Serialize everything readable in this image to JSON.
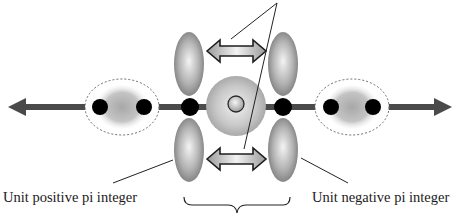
{
  "diagram": {
    "labels": {
      "left": "Unit positive pi integer",
      "right": "Unit negative pi integer"
    },
    "colors": {
      "axis": "#4a4a4a",
      "dot": "#000000",
      "lobe_light": "#f2f2f2",
      "lobe_dark": "#7d7d7d",
      "sphere_light": "#ececec",
      "sphere_dark": "#a9a9a9",
      "dashed_outline": "#666666",
      "pointer_line": "#222222"
    },
    "elements": {
      "axis_arrows": [
        "left",
        "right"
      ],
      "end_groups": [
        {
          "side": "left",
          "dots": 2,
          "outline": "dashed-ellipse"
        },
        {
          "side": "right",
          "dots": 2,
          "outline": "dashed-ellipse"
        }
      ],
      "center": {
        "junction_dots": 2,
        "lobes": 4,
        "double_arrows": 2,
        "nucleus": "sphere-with-inner-circle",
        "brace": "bottom"
      }
    }
  }
}
